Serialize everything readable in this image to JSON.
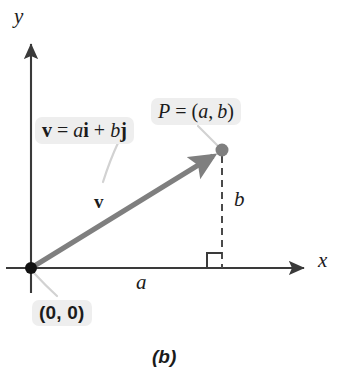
{
  "figure": {
    "caption": "(b)",
    "colors": {
      "axis": "#3a3a3a",
      "vector": "#7f7f7f",
      "point_dot": "#7f7f7f",
      "origin_dot": "#111111",
      "dashed": "#4a4a4a",
      "leader": "#d2d2d2",
      "label_plate": "#eeeeee",
      "text": "#1b1b1b",
      "background": "#ffffff"
    },
    "axes": {
      "x_label": "x",
      "y_label": "y",
      "origin_label": "(0, 0)"
    },
    "labels": {
      "point": {
        "prefix": "P",
        "equals": "=",
        "open": "(",
        "x_component": "a",
        "comma": ",",
        "y_component": "b",
        "close": ")"
      },
      "vector_equation": {
        "vector_symbol": "v",
        "equals": "=",
        "a_scalar": "a",
        "i_unit": "i",
        "plus": "+",
        "b_scalar": "b",
        "j_unit": "j"
      },
      "vector_name": "v",
      "horizontal_leg": "a",
      "vertical_leg": "b"
    },
    "geometry": {
      "origin": {
        "x": 31,
        "y": 268
      },
      "point_p": {
        "x": 222,
        "y": 150
      },
      "x_axis_start": {
        "x": 6,
        "y": 268
      },
      "x_axis_end": {
        "x": 308,
        "y": 268
      },
      "y_axis_top": {
        "x": 31,
        "y": 40
      },
      "y_axis_bottom": {
        "x": 31,
        "y": 293
      },
      "right_angle_size": 15
    }
  }
}
